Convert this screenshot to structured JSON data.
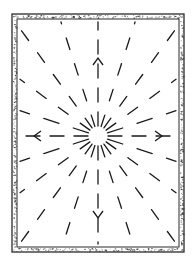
{
  "diagram": {
    "title": "",
    "colors": {
      "line": "#1a1a1a",
      "frame": "#2a2a2a",
      "background": "#ffffff"
    },
    "frame": {
      "x": 12,
      "y": 14,
      "width": 172,
      "height": 238,
      "border_width": 5
    },
    "center": {
      "x": 98,
      "y": 136
    },
    "rays": {
      "count": 20,
      "inner_radius": 10,
      "dash": 12,
      "gap": 11
    },
    "arrows": [
      {
        "direction": "up",
        "at": {
          "x": 98,
          "y": 58
        }
      },
      {
        "direction": "down",
        "at": {
          "x": 98,
          "y": 218
        }
      },
      {
        "direction": "left",
        "at": {
          "x": 34,
          "y": 136
        }
      },
      {
        "direction": "right",
        "at": {
          "x": 162,
          "y": 136
        }
      }
    ]
  }
}
